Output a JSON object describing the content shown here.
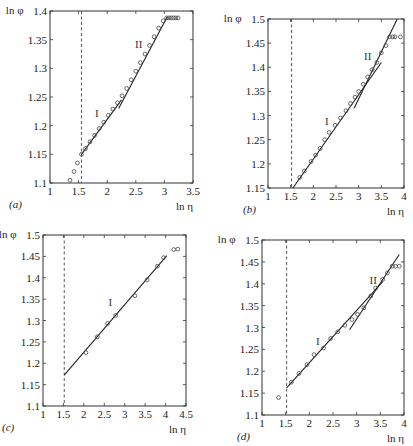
{
  "chart_data": [
    {
      "id": "a",
      "type": "scatter",
      "panel_label": "(a)",
      "xlabel": "ln η",
      "ylabel": "ln φ",
      "xlim": [
        1,
        3.5
      ],
      "ylim": [
        1.1,
        1.4
      ],
      "xticks": [
        "1",
        "1.5",
        "2",
        "2.5",
        "3",
        "3.5"
      ],
      "yticks": [
        "1.1",
        "1.15",
        "1.2",
        "1.25",
        "1.3",
        "1.35",
        "1.4"
      ],
      "dashed_x": 1.55,
      "region_labels": [
        {
          "text": "I",
          "x": 1.82,
          "y": 1.215
        },
        {
          "text": "II",
          "x": 2.55,
          "y": 1.335
        }
      ],
      "fits": [
        {
          "name": "I",
          "x": [
            1.55,
            2.25
          ],
          "y": [
            1.15,
            1.245
          ]
        },
        {
          "name": "II",
          "x": [
            2.2,
            3.05
          ],
          "y": [
            1.23,
            1.39
          ]
        }
      ],
      "points": {
        "x": [
          1.35,
          1.42,
          1.48,
          1.55,
          1.62,
          1.7,
          1.78,
          1.86,
          1.94,
          2.02,
          2.1,
          2.18,
          2.26,
          2.34,
          2.42,
          2.5,
          2.58,
          2.66,
          2.74,
          2.82,
          2.9,
          2.98,
          3.04,
          3.08,
          3.12,
          3.16,
          3.2,
          3.24
        ],
        "y": [
          1.105,
          1.12,
          1.135,
          1.15,
          1.16,
          1.172,
          1.183,
          1.195,
          1.206,
          1.218,
          1.229,
          1.24,
          1.252,
          1.265,
          1.28,
          1.295,
          1.31,
          1.325,
          1.34,
          1.355,
          1.37,
          1.383,
          1.388,
          1.388,
          1.388,
          1.388,
          1.388,
          1.388
        ]
      }
    },
    {
      "id": "b",
      "type": "scatter",
      "panel_label": "(b)",
      "xlabel": "ln η",
      "ylabel": "ln φ",
      "xlim": [
        1,
        4
      ],
      "ylim": [
        1.15,
        1.5
      ],
      "xticks": [
        "1",
        "1.5",
        "2",
        "2.5",
        "3",
        "3.5",
        "4"
      ],
      "yticks": [
        "1.15",
        "1.2",
        "1.25",
        "1.3",
        "1.35",
        "1.4",
        "1.45",
        "1.5"
      ],
      "dashed_x": 1.52,
      "region_labels": [
        {
          "text": "I",
          "x": 2.3,
          "y": 1.28
        },
        {
          "text": "II",
          "x": 3.2,
          "y": 1.415
        }
      ],
      "fits": [
        {
          "name": "I",
          "x": [
            1.55,
            3.5
          ],
          "y": [
            1.15,
            1.41
          ]
        },
        {
          "name": "II",
          "x": [
            2.9,
            3.85
          ],
          "y": [
            1.315,
            1.5
          ]
        }
      ],
      "points": {
        "x": [
          1.7,
          1.8,
          1.95,
          2.05,
          2.15,
          2.25,
          2.35,
          2.48,
          2.6,
          2.72,
          2.82,
          2.92,
          3.0,
          3.1,
          3.2,
          3.3,
          3.4,
          3.5,
          3.6,
          3.68,
          3.75,
          3.8,
          3.92
        ],
        "y": [
          1.172,
          1.185,
          1.205,
          1.218,
          1.232,
          1.25,
          1.265,
          1.28,
          1.295,
          1.31,
          1.325,
          1.338,
          1.35,
          1.365,
          1.38,
          1.395,
          1.41,
          1.43,
          1.445,
          1.463,
          1.463,
          1.463,
          1.463
        ]
      }
    },
    {
      "id": "c",
      "type": "scatter",
      "panel_label": "(c)",
      "xlabel": "ln η",
      "ylabel": "ln φ",
      "xlim": [
        1,
        4.5
      ],
      "ylim": [
        1.1,
        1.5
      ],
      "xticks": [
        "1",
        "1.5",
        "2",
        "2.5",
        "3",
        "3.5",
        "4",
        "4.5"
      ],
      "yticks": [
        "1.1",
        "1.15",
        "1.2",
        "1.25",
        "1.3",
        "1.35",
        "1.4",
        "1.45",
        "1.5"
      ],
      "dashed_x": 1.52,
      "region_labels": [
        {
          "text": "I",
          "x": 2.65,
          "y": 1.335
        }
      ],
      "fits": [
        {
          "name": "I",
          "x": [
            1.52,
            4.03
          ],
          "y": [
            1.172,
            1.452
          ]
        }
      ],
      "points": {
        "x": [
          2.05,
          2.33,
          2.58,
          2.78,
          3.25,
          3.55,
          3.8,
          3.95,
          4.2,
          4.3
        ],
        "y": [
          1.225,
          1.262,
          1.293,
          1.312,
          1.358,
          1.395,
          1.427,
          1.447,
          1.466,
          1.467
        ]
      }
    },
    {
      "id": "d",
      "type": "scatter",
      "panel_label": "(d)",
      "xlabel": "ln η",
      "ylabel": "ln φ",
      "xlim": [
        1,
        4
      ],
      "ylim": [
        1.1,
        1.5
      ],
      "xticks": [
        "1",
        "1.5",
        "2",
        "2.5",
        "3",
        "3.5",
        "4"
      ],
      "yticks": [
        "1.1",
        "1.15",
        "1.2",
        "1.25",
        "1.3",
        "1.35",
        "1.4",
        "1.45",
        "1.5"
      ],
      "dashed_x": 1.52,
      "region_labels": [
        {
          "text": "I",
          "x": 2.18,
          "y": 1.26
        },
        {
          "text": "II",
          "x": 3.35,
          "y": 1.4
        }
      ],
      "fits": [
        {
          "name": "I",
          "x": [
            1.52,
            3.55
          ],
          "y": [
            1.162,
            1.405
          ]
        },
        {
          "name": "II",
          "x": [
            2.85,
            3.9
          ],
          "y": [
            1.295,
            1.467
          ]
        }
      ],
      "points": {
        "x": [
          1.35,
          1.62,
          1.78,
          1.95,
          2.1,
          2.3,
          2.45,
          2.6,
          2.75,
          2.9,
          3.02,
          3.15,
          3.3,
          3.4,
          3.55,
          3.65,
          3.75,
          3.82,
          3.9
        ],
        "y": [
          1.14,
          1.175,
          1.195,
          1.215,
          1.238,
          1.253,
          1.275,
          1.29,
          1.305,
          1.318,
          1.33,
          1.345,
          1.372,
          1.39,
          1.41,
          1.425,
          1.44,
          1.44,
          1.44
        ]
      }
    }
  ],
  "layout": {
    "panels": [
      {
        "id": "a",
        "box": [
          50,
          11,
          193,
          183
        ]
      },
      {
        "id": "b",
        "box": [
          268,
          19,
          404,
          188
        ]
      },
      {
        "id": "c",
        "box": [
          43,
          235,
          186,
          406
        ]
      },
      {
        "id": "d",
        "box": [
          262,
          240,
          404,
          415
        ]
      }
    ]
  }
}
